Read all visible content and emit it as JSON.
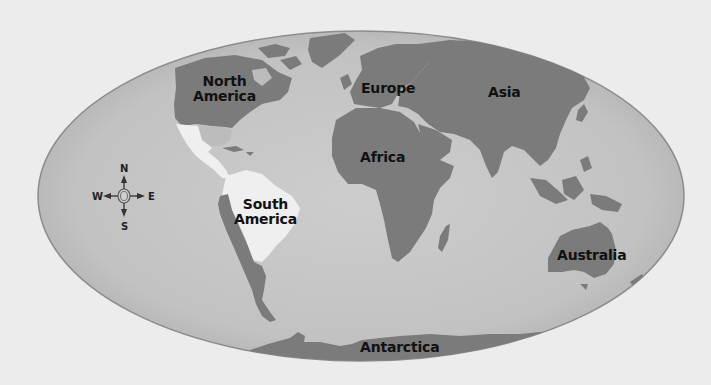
{
  "map": {
    "projection": "mollweide-like oval world map",
    "colors": {
      "page_background": "#ececec",
      "ocean": "#c4c4c4",
      "ocean_edge": "#b4b4b4",
      "oval_outline": "#8c8c8c",
      "land": "#7b7b7b",
      "land_light": "#bcbcbc",
      "highlight_land": "#efefef",
      "label_text": "#111111"
    },
    "labels": {
      "north_america_line1": "North",
      "north_america_line2": "America",
      "south_america_line1": "South",
      "south_america_line2": "America",
      "europe": "Europe",
      "asia": "Asia",
      "africa": "Africa",
      "australia": "Australia",
      "antarctica": "Antarctica"
    },
    "compass": {
      "north": "N",
      "south": "S",
      "east": "E",
      "west": "W"
    }
  }
}
